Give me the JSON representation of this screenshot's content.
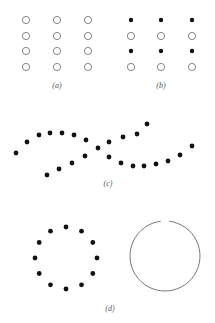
{
  "figure": {
    "panels": [
      {
        "id": "a",
        "label": "(a)",
        "description": "4x3 grid of open circles",
        "columns_x": [
          26,
          57,
          88
        ],
        "rows_y": [
          20,
          36,
          51,
          67
        ],
        "row_styles": [
          "open",
          "open",
          "open",
          "open"
        ]
      },
      {
        "id": "b",
        "label": "(b)",
        "description": "4x3 grid alternating filled dots and open circles by row",
        "columns_x": [
          131,
          161,
          192
        ],
        "rows_y": [
          20,
          36,
          51,
          67
        ],
        "row_styles": [
          "filled",
          "open",
          "filled",
          "open"
        ]
      },
      {
        "id": "c",
        "label": "(c)",
        "description": "Two crossing curved lines of dots",
        "curve1": [
          [
            16,
            153
          ],
          [
            27,
            142
          ],
          [
            39,
            135
          ],
          [
            50,
            133
          ],
          [
            62,
            133
          ],
          [
            74,
            135
          ],
          [
            86,
            140
          ],
          [
            98,
            148
          ],
          [
            109,
            142
          ],
          [
            123,
            137
          ],
          [
            137,
            134
          ],
          [
            147,
            124
          ]
        ],
        "curve2": [
          [
            47,
            175
          ],
          [
            59,
            169
          ],
          [
            72,
            163
          ],
          [
            85,
            156
          ],
          [
            109,
            157
          ],
          [
            121,
            163
          ],
          [
            133,
            166
          ],
          [
            144,
            166
          ],
          [
            156,
            164
          ],
          [
            168,
            161
          ],
          [
            180,
            155
          ],
          [
            192,
            146
          ]
        ]
      },
      {
        "id": "d",
        "label": "(d)",
        "description": "Ring of 12 dots beside a circle with a small gap at top",
        "dot_ring": {
          "cx": 66,
          "cy": 258,
          "r": 31,
          "count": 12
        },
        "circle": {
          "cx": 165,
          "cy": 256,
          "r": 35,
          "gap_deg": 14
        }
      }
    ],
    "colors": {
      "ink": "#111111",
      "outline": "#777777",
      "label": "#555555"
    }
  }
}
